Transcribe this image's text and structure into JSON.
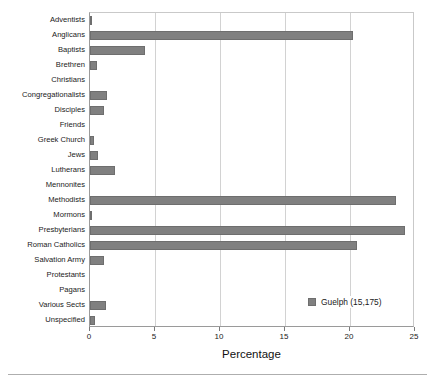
{
  "chart_data": {
    "type": "bar",
    "orientation": "horizontal",
    "title": "",
    "xlabel": "Percentage",
    "ylabel": "",
    "xlim": [
      0,
      25
    ],
    "xticks": [
      0,
      5,
      10,
      15,
      20,
      25
    ],
    "xtick_labels": [
      "0",
      "5",
      "10",
      "15",
      "20",
      "25"
    ],
    "grid": "vertical",
    "legend_position": "lower-right-inside",
    "bar_color": "#808080",
    "bar_edge_color": "#6e6e6e",
    "series": [
      {
        "name": "Guelph (15,175)",
        "values": [
          0.15,
          20.2,
          4.2,
          0.5,
          0.0,
          1.3,
          1.1,
          0.0,
          0.3,
          0.6,
          1.9,
          0.0,
          23.5,
          0.15,
          24.2,
          20.5,
          1.1,
          0.0,
          0.0,
          1.2,
          0.4
        ]
      }
    ],
    "categories": [
      "Adventists",
      "Anglicans",
      "Baptists",
      "Brethren",
      "Christians",
      "Congregationalists",
      "Disciples",
      "Friends",
      "Greek Church",
      "Jews",
      "Lutherans",
      "Mennonites",
      "Methodists",
      "Mormons",
      "Presbyterians",
      "Roman Catholics",
      "Salvation Army",
      "Protestants",
      "Pagans",
      "Various Sects",
      "Unspecified"
    ]
  },
  "legend": {
    "entries": [
      {
        "label": "Guelph (15,175)",
        "color": "#808080"
      }
    ]
  }
}
